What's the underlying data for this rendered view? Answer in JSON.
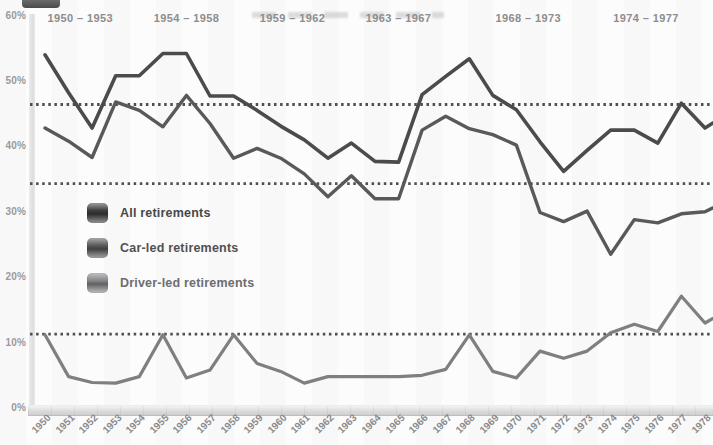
{
  "chart_data": {
    "type": "line",
    "title": "",
    "years": [
      "1950",
      "1951",
      "1952",
      "1953",
      "1954",
      "1955",
      "1956",
      "1957",
      "1958",
      "1959",
      "1960",
      "1961",
      "1962",
      "1963",
      "1964",
      "1965",
      "1966",
      "1967",
      "1968",
      "1969",
      "1970",
      "1971",
      "1972",
      "1973",
      "1974",
      "1975",
      "1976",
      "1977",
      "1978"
    ],
    "eras": [
      "1950 – 1953",
      "1954 – 1958",
      "1959 – 1962",
      "1963 – 1967",
      "1968 – 1973",
      "1974 – 1977"
    ],
    "era_ranges": [
      [
        1950,
        1953
      ],
      [
        1954,
        1958
      ],
      [
        1959,
        1962
      ],
      [
        1963,
        1967
      ],
      [
        1968,
        1973
      ],
      [
        1974,
        1977
      ]
    ],
    "y_ticks": [
      "60%",
      "50%",
      "40%",
      "30%",
      "20%",
      "10%",
      "0%"
    ],
    "ylim": [
      0,
      60
    ],
    "xlabel": "",
    "ylabel": "",
    "grid": false,
    "legend_position": "middle-left",
    "series": [
      {
        "name": "All retirements",
        "color": "#4b4b4d",
        "values": [
          54,
          48.2,
          42.8,
          50.8,
          50.8,
          54.2,
          54.2,
          47.7,
          47.7,
          45.5,
          43.1,
          41,
          38.2,
          40.5,
          37.7,
          37.6,
          47.9,
          50.7,
          53.4,
          47.8,
          45.6,
          40.7,
          36.2,
          39.4,
          42.5,
          42.5,
          40.5,
          46.6,
          42.8
        ],
        "edge_value": 43.6
      },
      {
        "name": "Car-led retirements",
        "color": "#59595b",
        "values": [
          42.8,
          40.8,
          38.3,
          46.8,
          45.5,
          43,
          47.8,
          43.5,
          38.2,
          39.7,
          38.2,
          35.8,
          32.3,
          35.5,
          32,
          32,
          42.5,
          44.6,
          42.7,
          41.8,
          40.2,
          29.9,
          28.5,
          30.1,
          23.5,
          28.8,
          28.3,
          29.7,
          30
        ],
        "edge_value": 30.6
      },
      {
        "name": "Driver-led retirements",
        "color": "#7f7f82",
        "values": [
          11.2,
          4.8,
          3.9,
          3.8,
          4.8,
          11.2,
          4.6,
          5.8,
          11.2,
          6.8,
          5.6,
          3.8,
          4.8,
          4.8,
          4.8,
          4.8,
          5,
          5.9,
          11.2,
          5.6,
          4.6,
          8.7,
          7.6,
          8.7,
          11.5,
          12.8,
          11.7,
          17.1,
          13
        ],
        "edge_value": 13.7
      }
    ],
    "reference_lines": {
      "values": [
        46.4,
        34.3,
        11.3
      ],
      "color": "#4f4f51",
      "style": "dotted"
    },
    "legend": [
      {
        "label": "All retirements",
        "swatch_color": "#3c3c3e",
        "label_color": "#48484a"
      },
      {
        "label": "Car-led retirements",
        "swatch_color": "#58585a",
        "label_color": "#515153"
      },
      {
        "label": "Driver-led retirements",
        "swatch_color": "#86868a",
        "label_color": "#6d6d6f"
      }
    ]
  }
}
